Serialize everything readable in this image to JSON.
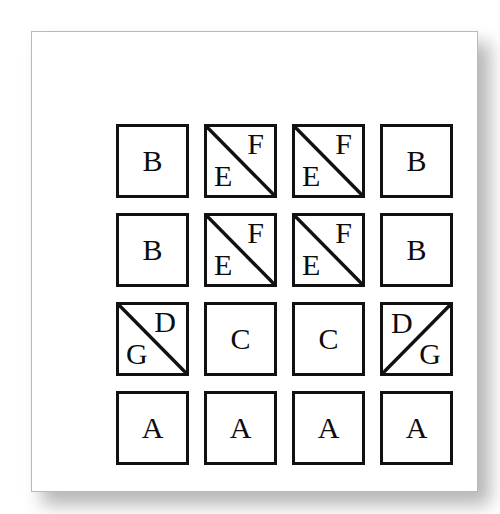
{
  "figure": {
    "title": "",
    "background_color": "#ffffff",
    "card_color": "#ffffff",
    "card_border_color": "#b9b9b9",
    "shadow_color": "#9a9a9a",
    "stroke_color": "#111111",
    "text_color": "#0c0c0c",
    "grid": {
      "rows": 4,
      "columns": 4
    }
  },
  "cells": [
    {
      "row": 1,
      "col": 1,
      "split": "none",
      "labels": [
        "B"
      ]
    },
    {
      "row": 1,
      "col": 2,
      "split": "backslash",
      "labels": [
        "E",
        "F"
      ]
    },
    {
      "row": 1,
      "col": 3,
      "split": "backslash",
      "labels": [
        "E",
        "F"
      ]
    },
    {
      "row": 1,
      "col": 4,
      "split": "none",
      "labels": [
        "B"
      ]
    },
    {
      "row": 2,
      "col": 1,
      "split": "none",
      "labels": [
        "B"
      ]
    },
    {
      "row": 2,
      "col": 2,
      "split": "backslash",
      "labels": [
        "E",
        "F"
      ]
    },
    {
      "row": 2,
      "col": 3,
      "split": "backslash",
      "labels": [
        "E",
        "F"
      ]
    },
    {
      "row": 2,
      "col": 4,
      "split": "none",
      "labels": [
        "B"
      ]
    },
    {
      "row": 3,
      "col": 1,
      "split": "backslash",
      "labels": [
        "G",
        "D"
      ]
    },
    {
      "row": 3,
      "col": 2,
      "split": "none",
      "labels": [
        "C"
      ]
    },
    {
      "row": 3,
      "col": 3,
      "split": "none",
      "labels": [
        "C"
      ]
    },
    {
      "row": 3,
      "col": 4,
      "split": "slash",
      "labels": [
        "D",
        "G"
      ]
    },
    {
      "row": 4,
      "col": 1,
      "split": "none",
      "labels": [
        "A"
      ]
    },
    {
      "row": 4,
      "col": 2,
      "split": "none",
      "labels": [
        "A"
      ]
    },
    {
      "row": 4,
      "col": 3,
      "split": "none",
      "labels": [
        "A"
      ]
    },
    {
      "row": 4,
      "col": 4,
      "split": "none",
      "labels": [
        "A"
      ]
    }
  ],
  "letters": {
    "r1c1": "B",
    "r1c2_lower_left": "E",
    "r1c2_upper_right": "F",
    "r1c3_lower_left": "E",
    "r1c3_upper_right": "F",
    "r1c4": "B",
    "r2c1": "B",
    "r2c2_lower_left": "E",
    "r2c2_upper_right": "F",
    "r2c3_lower_left": "E",
    "r2c3_upper_right": "F",
    "r2c4": "B",
    "r3c1_lower_left": "G",
    "r3c1_upper_right": "D",
    "r3c2": "C",
    "r3c3": "C",
    "r3c4_upper_left": "D",
    "r3c4_lower_right": "G",
    "r4c1": "A",
    "r4c2": "A",
    "r4c3": "A",
    "r4c4": "A"
  }
}
